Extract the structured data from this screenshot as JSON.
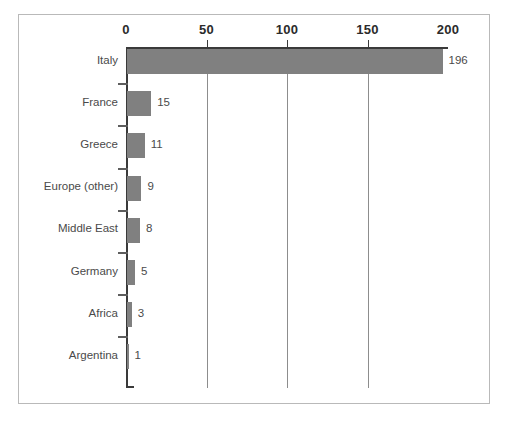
{
  "chart_data": {
    "type": "bar",
    "orientation": "horizontal",
    "title": "",
    "subtitle": "",
    "xlabel": "",
    "ylabel": "",
    "xlim": [
      0,
      200
    ],
    "xticks": [
      0,
      50,
      100,
      150,
      200
    ],
    "xtick_labels": [
      "0",
      "50",
      "100",
      "150",
      "200"
    ],
    "grid": "vertical",
    "grid_at": [
      50,
      100,
      150
    ],
    "axis_position": "top",
    "legend": "none",
    "bar_color": "#808080",
    "text_color": "#4a4a4a",
    "axis_color": "#3a3a3a",
    "grid_color": "#8d8d8d",
    "frame_color": "#b9b9b9",
    "background": "#ffffff",
    "categories": [
      "Italy",
      "France",
      "Greece",
      "Europe (other)",
      "Middle East",
      "Germany",
      "Africa",
      "Argentina"
    ],
    "values": [
      196,
      15,
      11,
      9,
      8,
      5,
      3,
      1
    ],
    "value_labels": [
      "196",
      "15",
      "11",
      "9",
      "8",
      "5",
      "3",
      "1"
    ]
  }
}
